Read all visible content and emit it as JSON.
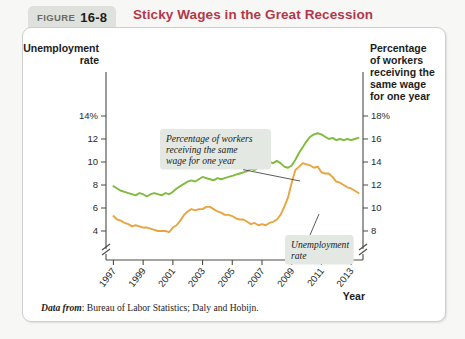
{
  "figure": {
    "label": "FIGURE",
    "number": "16-8",
    "title": "Sticky Wages in the Great Recession"
  },
  "source": {
    "lead": "Data from",
    "text": ": Bureau of Labor Statistics; Daly and Hobijn."
  },
  "callouts": [
    {
      "id": "green-callout",
      "lines": [
        "Percentage of workers",
        "receiving the same",
        "wage for one year"
      ]
    },
    {
      "id": "orange-callout",
      "lines": [
        "Unemployment",
        "rate"
      ]
    }
  ],
  "chart_data": {
    "type": "line",
    "title": "Sticky Wages in the Great Recession",
    "xlabel": "Year",
    "x_tick_labels": [
      "1997",
      "1999",
      "2001",
      "2003",
      "2005",
      "2007",
      "2009",
      "2011",
      "2013"
    ],
    "x_tick_values": [
      1997,
      1999,
      2001,
      2003,
      2005,
      2007,
      2009,
      2011,
      2013
    ],
    "xlim": [
      1996.5,
      2013.8
    ],
    "grid": false,
    "axis_break": true,
    "legend_position": "inline-callouts",
    "left_axis": {
      "name_lines": [
        "Unemployment",
        "rate"
      ],
      "tick_labels": [
        "14%",
        "12",
        "10",
        "8",
        "6",
        "4"
      ],
      "tick_values": [
        14,
        12,
        10,
        8,
        6,
        4
      ],
      "ylim": [
        3.4,
        14.8
      ],
      "unit": "percent"
    },
    "right_axis": {
      "name_lines": [
        "Percentage",
        "of workers",
        "receiving the",
        "same wage",
        "for one year"
      ],
      "tick_labels": [
        "18%",
        "16",
        "14",
        "12",
        "10",
        "8"
      ],
      "tick_values": [
        18,
        16,
        14,
        12,
        10,
        8
      ],
      "ylim": [
        7.4,
        18.8
      ],
      "unit": "percent"
    },
    "series": [
      {
        "name": "Percentage of workers receiving the same wage for one year",
        "axis": "right",
        "color": "#7fbb3c",
        "x": [
          1997.0,
          1997.25,
          1997.5,
          1997.75,
          1998.0,
          1998.25,
          1998.5,
          1998.75,
          1999.0,
          1999.25,
          1999.5,
          1999.75,
          2000.0,
          2000.25,
          2000.5,
          2000.75,
          2001.0,
          2001.25,
          2001.5,
          2001.75,
          2002.0,
          2002.25,
          2002.5,
          2002.75,
          2003.0,
          2003.25,
          2003.5,
          2003.75,
          2004.0,
          2004.25,
          2004.5,
          2004.75,
          2005.0,
          2005.25,
          2005.5,
          2005.75,
          2006.0,
          2006.25,
          2006.5,
          2006.75,
          2007.0,
          2007.25,
          2007.5,
          2007.75,
          2008.0,
          2008.25,
          2008.5,
          2008.75,
          2009.0,
          2009.25,
          2009.5,
          2009.75,
          2010.0,
          2010.25,
          2010.5,
          2010.75,
          2011.0,
          2011.25,
          2011.5,
          2011.75,
          2012.0,
          2012.25,
          2012.5,
          2012.75,
          2013.0,
          2013.25,
          2013.5
        ],
        "y": [
          11.9,
          11.7,
          11.5,
          11.4,
          11.3,
          11.2,
          11.1,
          11.3,
          11.2,
          11.0,
          11.2,
          11.3,
          11.2,
          11.1,
          11.3,
          11.2,
          11.4,
          11.7,
          11.9,
          12.1,
          12.3,
          12.4,
          12.3,
          12.5,
          12.7,
          12.6,
          12.5,
          12.4,
          12.6,
          12.5,
          12.6,
          12.7,
          12.8,
          12.9,
          13.0,
          13.1,
          13.2,
          13.4,
          13.3,
          13.5,
          13.6,
          13.8,
          14.0,
          13.9,
          14.1,
          13.9,
          13.6,
          13.5,
          13.7,
          14.2,
          14.8,
          15.3,
          15.8,
          16.2,
          16.4,
          16.5,
          16.4,
          16.2,
          16.0,
          16.1,
          15.9,
          16.0,
          15.9,
          16.0,
          15.9,
          16.0,
          16.1
        ]
      },
      {
        "name": "Unemployment rate",
        "axis": "left",
        "color": "#e8a53f",
        "x": [
          1997.0,
          1997.25,
          1997.5,
          1997.75,
          1998.0,
          1998.25,
          1998.5,
          1998.75,
          1999.0,
          1999.25,
          1999.5,
          1999.75,
          2000.0,
          2000.25,
          2000.5,
          2000.75,
          2001.0,
          2001.25,
          2001.5,
          2001.75,
          2002.0,
          2002.25,
          2002.5,
          2002.75,
          2003.0,
          2003.25,
          2003.5,
          2003.75,
          2004.0,
          2004.25,
          2004.5,
          2004.75,
          2005.0,
          2005.25,
          2005.5,
          2005.75,
          2006.0,
          2006.25,
          2006.5,
          2006.75,
          2007.0,
          2007.25,
          2007.5,
          2007.75,
          2008.0,
          2008.25,
          2008.5,
          2008.75,
          2009.0,
          2009.25,
          2009.5,
          2009.75,
          2010.0,
          2010.25,
          2010.5,
          2010.75,
          2011.0,
          2011.25,
          2011.5,
          2011.75,
          2012.0,
          2012.25,
          2012.5,
          2012.75,
          2013.0,
          2013.25,
          2013.5
        ],
        "y": [
          5.3,
          5.0,
          4.9,
          4.7,
          4.6,
          4.4,
          4.5,
          4.4,
          4.3,
          4.3,
          4.2,
          4.1,
          4.0,
          4.0,
          4.0,
          3.9,
          4.3,
          4.5,
          4.9,
          5.4,
          5.7,
          5.9,
          5.8,
          5.9,
          5.9,
          6.1,
          6.1,
          5.9,
          5.7,
          5.6,
          5.4,
          5.4,
          5.3,
          5.1,
          5.0,
          5.0,
          4.8,
          4.6,
          4.7,
          4.5,
          4.6,
          4.5,
          4.7,
          4.8,
          5.0,
          5.4,
          6.1,
          6.9,
          8.2,
          9.3,
          9.6,
          9.9,
          9.8,
          9.7,
          9.5,
          9.6,
          9.1,
          9.0,
          9.0,
          8.7,
          8.3,
          8.2,
          8.0,
          7.8,
          7.7,
          7.5,
          7.3
        ]
      }
    ]
  }
}
